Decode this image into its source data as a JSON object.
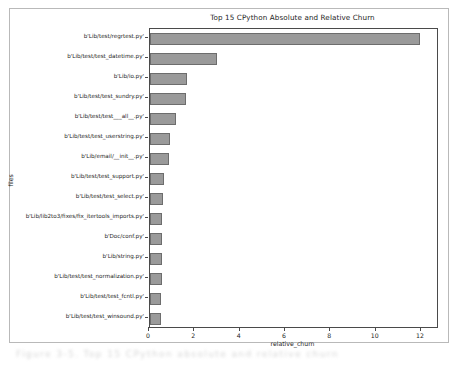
{
  "chart_data": {
    "type": "bar",
    "orientation": "horizontal",
    "title": "Top 15 CPython Absolute and Relative Churn",
    "xlabel": "relative_churn",
    "ylabel": "files",
    "xlim": [
      0,
      12.75
    ],
    "xticks": [
      0,
      2,
      4,
      6,
      8,
      10,
      12
    ],
    "xtick_labels": [
      "0",
      "2",
      "4",
      "6",
      "8",
      "10",
      "12"
    ],
    "grid": false,
    "legend": null,
    "bar_color": "#9a9a9a",
    "bar_edge_color": "#6d6d6d",
    "categories": [
      "b'Lib/test/regrtest.py'",
      "b'Lib/test/test_datetime.py'",
      "b'Lib/io.py'",
      "b'Lib/test/test_sundry.py'",
      "b'Lib/test/test___all__.py'",
      "b'Lib/test/test_userstring.py'",
      "b'Lib/email/__init__.py'",
      "b'Lib/test/test_support.py'",
      "b'Lib/test/test_select.py'",
      "b'Lib/lib2to3/fixes/fix_itertools_imports.py'",
      "b'Doc/conf.py'",
      "b'Lib/string.py'",
      "b'Lib/test/test_normalization.py'",
      "b'Lib/test/test_fcntl.py'",
      "b'Lib/test/test_winsound.py'"
    ],
    "values": [
      11.9,
      2.95,
      1.63,
      1.6,
      1.15,
      0.9,
      0.82,
      0.6,
      0.57,
      0.55,
      0.55,
      0.53,
      0.53,
      0.5,
      0.5
    ]
  },
  "caption": {
    "text": "Figure 3-5. Top 15 CPython absolute and relative churn"
  }
}
